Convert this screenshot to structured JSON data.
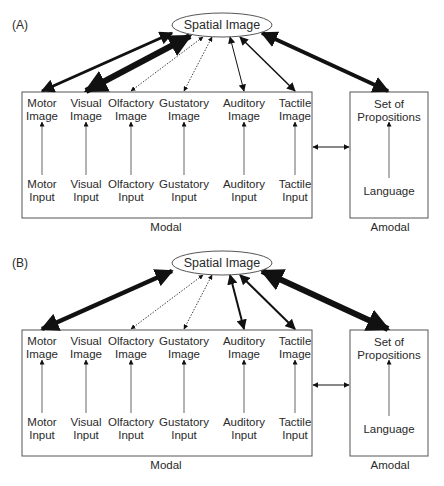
{
  "panels": [
    {
      "id": "A",
      "label": "(A)",
      "center_node": "Spatial Image",
      "modal_caption": "Modal",
      "amodal_caption": "Amodal",
      "modal_columns": [
        {
          "image": [
            "Motor",
            "Image"
          ],
          "input": [
            "Motor",
            "Input"
          ],
          "link": "thick",
          "weight": 3
        },
        {
          "image": [
            "Visual",
            "Image"
          ],
          "input": [
            "Visual",
            "Input"
          ],
          "link": "very-thick",
          "weight": 6
        },
        {
          "image": [
            "Olfactory",
            "Image"
          ],
          "input": [
            "Olfactory",
            "Input"
          ],
          "link": "dotted",
          "weight": 0.8
        },
        {
          "image": [
            "Gustatory",
            "Image"
          ],
          "input": [
            "Gustatory",
            "Input"
          ],
          "link": "dotted",
          "weight": 0.8
        },
        {
          "image": [
            "Auditory",
            "Image"
          ],
          "input": [
            "Auditory",
            "Input"
          ],
          "link": "thin",
          "weight": 1
        },
        {
          "image": [
            "Tactile",
            "Image"
          ],
          "input": [
            "Tactile",
            "Input"
          ],
          "link": "medium",
          "weight": 1.5
        }
      ],
      "amodal": {
        "top": [
          "Set of",
          "Propositions"
        ],
        "bottom": "Language",
        "link": "thick",
        "weight": 4
      }
    },
    {
      "id": "B",
      "label": "(B)",
      "center_node": "Spatial Image",
      "modal_caption": "Modal",
      "amodal_caption": "Amodal",
      "modal_columns": [
        {
          "image": [
            "Motor",
            "Image"
          ],
          "input": [
            "Motor",
            "Input"
          ],
          "link": "very-thick",
          "weight": 4.5
        },
        {
          "image": [
            "Visual",
            "Image"
          ],
          "input": [
            "Visual",
            "Input"
          ],
          "link": "none",
          "weight": 0
        },
        {
          "image": [
            "Olfactory",
            "Image"
          ],
          "input": [
            "Olfactory",
            "Input"
          ],
          "link": "dotted",
          "weight": 0.8
        },
        {
          "image": [
            "Gustatory",
            "Image"
          ],
          "input": [
            "Gustatory",
            "Input"
          ],
          "link": "dotted",
          "weight": 0.8
        },
        {
          "image": [
            "Auditory",
            "Image"
          ],
          "input": [
            "Auditory",
            "Input"
          ],
          "link": "medium",
          "weight": 2
        },
        {
          "image": [
            "Tactile",
            "Image"
          ],
          "input": [
            "Tactile",
            "Input"
          ],
          "link": "medium",
          "weight": 2
        }
      ],
      "amodal": {
        "top": [
          "Set of",
          "Propositions"
        ],
        "bottom": "Language",
        "link": "very-thick",
        "weight": 6
      }
    }
  ],
  "colors": {
    "line": "#111111",
    "box": "#555555",
    "text": "#2a2a2a"
  }
}
